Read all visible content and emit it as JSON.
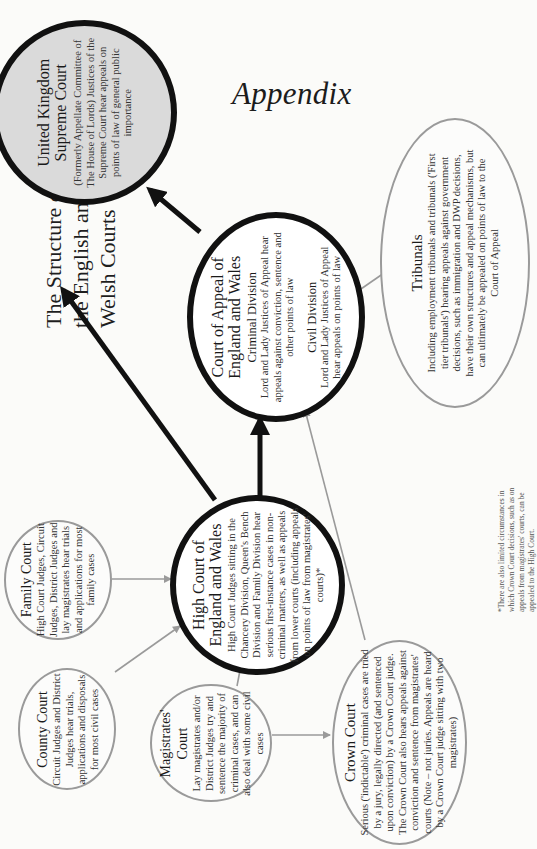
{
  "header": {
    "appendix": "Appendix",
    "title_lines": [
      "The Structure of",
      "the English and",
      "Welsh Courts"
    ]
  },
  "courts": {
    "supreme": {
      "title_lines": [
        "United Kingdom",
        "Supreme Court"
      ],
      "text": "(Formerly Appellate Committee of The House of Lords) Justices of the Supreme Court hear appeals on points of law of general public importance"
    },
    "appeal": {
      "title_lines": [
        "Court of Appeal of",
        "England and Wales"
      ],
      "criminal_heading": "Criminal Division",
      "criminal_text": "Lord and Lady Justices of Appeal hear appeals against conviction, sentence and other points of law",
      "civil_heading": "Civil Division",
      "civil_text": "Lord and Lady Justices of Appeal hear appeals on points of law"
    },
    "tribunals": {
      "title": "Tribunals",
      "text": "Including employment tribunals and tribunals ('First tier tribunals') hearing appeals against government decisions, such as immigration and DWP decisions, have their own structures and appeal mechanisms, but can ultimately be appealed on points of law to the Court of Appeal"
    },
    "high": {
      "title_lines": [
        "High Court of",
        "England and Wales"
      ],
      "text": "High Court Judges sitting in the Chancery Division, Queen's Bench Division and Family Division hear serious first-instance cases in non-criminal matters, as well as appeals from lower courts (including appeals on points of law from magistrates' courts)*"
    },
    "family": {
      "title": "Family Court",
      "text": "High Court Judges, Circuit Judges, District Judges and lay magistrates hear trials and applications for most family cases"
    },
    "county": {
      "title": "County Court",
      "text": "Circuit Judges and District Judges hear trials, applications and disposals for most civil cases"
    },
    "magistrates": {
      "title_lines": [
        "Magistrates'",
        "Court"
      ],
      "text": "Lay magistrates and/or District Judges try and sentence the majority of criminal cases, and can also deal with some civil cases"
    },
    "crown": {
      "title": "Crown Court",
      "text": "Serious ('indictable') criminal cases are tried by a jury, legally directed (and sentenced upon conviction) by a Crown Court judge. The Crown Court also hears appeals against conviction and sentence from magistrates' courts (Note – not juries. Appeals are heard by a Crown Court judge sitting with two magistrates)"
    }
  },
  "footnote": "*There are also limited circumstances in which Crown Court decisions, such as on appeals from magistrates' courts, can be appealed to the High Court.",
  "colors": {
    "bold_line": "#111111",
    "thin_line": "#9a9a9a",
    "supreme_fill": "#dadada",
    "background": "#fbfbf9"
  }
}
